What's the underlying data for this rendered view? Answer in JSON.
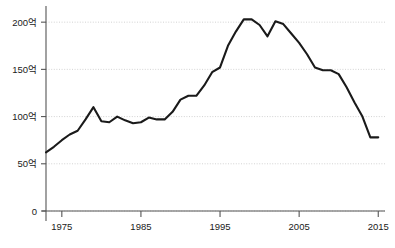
{
  "chart_data": {
    "type": "line",
    "title": "",
    "subtitle": "",
    "xlabel": "",
    "ylabel": "",
    "xlim": [
      1973,
      2015
    ],
    "ylim": [
      0,
      215
    ],
    "grid": true,
    "legend": false,
    "legend_position": "none",
    "y_ticks": [
      {
        "value": 0,
        "label": "0"
      },
      {
        "value": 50,
        "label": "50억"
      },
      {
        "value": 100,
        "label": "100억"
      },
      {
        "value": 150,
        "label": "150억"
      },
      {
        "value": 200,
        "label": "200억"
      }
    ],
    "x_ticks": [
      {
        "value": 1975,
        "label": "1975"
      },
      {
        "value": 1985,
        "label": "1985"
      },
      {
        "value": 1995,
        "label": "1995"
      },
      {
        "value": 2005,
        "label": "2005"
      },
      {
        "value": 2015,
        "label": "2015"
      }
    ],
    "series": [
      {
        "name": "value",
        "color": "#1a1a1a",
        "x": [
          1973,
          1974,
          1975,
          1976,
          1977,
          1978,
          1979,
          1980,
          1981,
          1982,
          1983,
          1984,
          1985,
          1986,
          1987,
          1988,
          1989,
          1990,
          1991,
          1992,
          1993,
          1994,
          1995,
          1996,
          1997,
          1998,
          1999,
          2000,
          2001,
          2002,
          2003,
          2004,
          2005,
          2006,
          2007,
          2008,
          2009,
          2010,
          2011,
          2012,
          2013,
          2014,
          2015
        ],
        "values": [
          62,
          68,
          75,
          81,
          85,
          97,
          110,
          95,
          94,
          100,
          96,
          93,
          94,
          99,
          97,
          97,
          105,
          118,
          122,
          122,
          133,
          147,
          152,
          175,
          190,
          203,
          203,
          197,
          185,
          201,
          198,
          188,
          178,
          166,
          152,
          149,
          149,
          145,
          131,
          115,
          100,
          78,
          78
        ],
        "values_note": "read off axis gridlines"
      }
    ],
    "units": "억"
  }
}
